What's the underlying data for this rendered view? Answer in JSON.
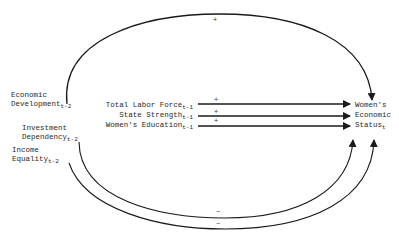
{
  "diagram": {
    "type": "path-diagram",
    "top_cut_text": "",
    "sources_lagged_t2": [
      {
        "id": "econ_dev",
        "lines": [
          "Economic",
          "Development"
        ],
        "subscript": "t-2"
      },
      {
        "id": "invest_dep",
        "lines": [
          "Investment",
          "Dependency"
        ],
        "subscript": "t-2"
      },
      {
        "id": "income_eq",
        "lines": [
          "Income",
          "Equality"
        ],
        "subscript": "t-2"
      }
    ],
    "sources_lagged_t1": [
      {
        "id": "labor_force",
        "label": "Total Labor Force",
        "subscript": "t-1"
      },
      {
        "id": "state_strength",
        "label": "State Strength",
        "subscript": "t-1"
      },
      {
        "id": "womens_edu",
        "label": "Women's Education",
        "subscript": "t-1"
      }
    ],
    "outcome": {
      "id": "womens_status",
      "lines": [
        "Women's",
        "Economic",
        "Status"
      ],
      "subscript": "t"
    },
    "edges": [
      {
        "from": "econ_dev",
        "to": "womens_status",
        "sign": "+"
      },
      {
        "from": "labor_force",
        "to": "womens_status",
        "sign": "+"
      },
      {
        "from": "state_strength",
        "to": "womens_status",
        "sign": "+"
      },
      {
        "from": "womens_edu",
        "to": "womens_status",
        "sign": "+"
      },
      {
        "from": "invest_dep",
        "to": "womens_status",
        "sign": "−"
      },
      {
        "from": "income_eq",
        "to": "womens_status",
        "sign": "−"
      }
    ],
    "colors": {
      "line": "#1a1a1a",
      "text": "#2a2a2a",
      "background": "#ffffff"
    }
  }
}
